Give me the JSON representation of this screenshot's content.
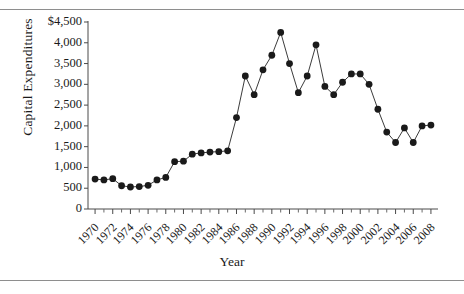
{
  "chart_data": {
    "type": "line",
    "title": "",
    "xlabel": "Year",
    "ylabel": "Capital Expenditures",
    "xlim": [
      1969.2,
      2008.8
    ],
    "ylim": [
      0,
      4500
    ],
    "grid": false,
    "legend": null,
    "marker": "filled-circle",
    "y_tick_labels": [
      "$4,500",
      "4,000",
      "3,500",
      "3,000",
      "2,500",
      "2,000",
      "1,500",
      "1,000",
      "500",
      "0"
    ],
    "y_ticks": [
      4500,
      4000,
      3500,
      3000,
      2500,
      2000,
      1500,
      1000,
      500,
      0
    ],
    "x_tick_labels": [
      "1970",
      "1972",
      "1974",
      "1976",
      "1978",
      "1980",
      "1982",
      "1984",
      "1986",
      "1988",
      "1990",
      "1992",
      "1994",
      "1996",
      "1998",
      "2000",
      "2002",
      "2004",
      "2006",
      "2008"
    ],
    "x_ticks": [
      1970,
      1972,
      1974,
      1976,
      1978,
      1980,
      1982,
      1984,
      1986,
      1988,
      1990,
      1992,
      1994,
      1996,
      1998,
      2000,
      2002,
      2004,
      2006,
      2008
    ],
    "x_minor_ticks": [
      1971,
      1973,
      1975,
      1977,
      1979,
      1981,
      1983,
      1985,
      1987,
      1989,
      1991,
      1993,
      1995,
      1997,
      1999,
      2001,
      2003,
      2005,
      2007
    ],
    "x": [
      1970,
      1971,
      1972,
      1973,
      1974,
      1975,
      1976,
      1977,
      1978,
      1979,
      1980,
      1981,
      1982,
      1983,
      1984,
      1985,
      1986,
      1987,
      1988,
      1989,
      1990,
      1991,
      1992,
      1993,
      1994,
      1995,
      1996,
      1997,
      1998,
      1999,
      2000,
      2001,
      2002,
      2003,
      2004,
      2005,
      2006,
      2007,
      2008
    ],
    "values": [
      720,
      700,
      730,
      560,
      530,
      540,
      570,
      700,
      760,
      1140,
      1150,
      1320,
      1350,
      1370,
      1380,
      1400,
      2200,
      3200,
      2750,
      3350,
      3700,
      4250,
      3500,
      2800,
      3200,
      3950,
      2950,
      2750,
      3050,
      3250,
      3250,
      3000,
      2400,
      1850,
      1600,
      1950,
      1600,
      2000,
      2020
    ],
    "series_color": "#1a1a1a",
    "line_color": "#3c3c3c"
  },
  "axis": {
    "x_title": "Year",
    "y_title": "Capital Expenditures"
  }
}
